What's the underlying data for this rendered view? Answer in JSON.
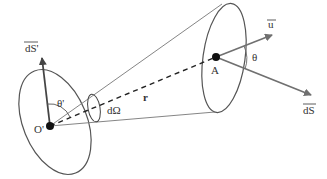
{
  "diagram": {
    "labels": {
      "origin": "O'",
      "target": "A",
      "normal_source": "dS'",
      "normal_target": "dS",
      "direction": "u",
      "angle_source": "θ'",
      "angle_target": "θ",
      "solid_angle": "dΩ",
      "distance": "r"
    },
    "colors": {
      "stroke": "#555555",
      "arrow": "#707070",
      "point": "#111111"
    }
  }
}
